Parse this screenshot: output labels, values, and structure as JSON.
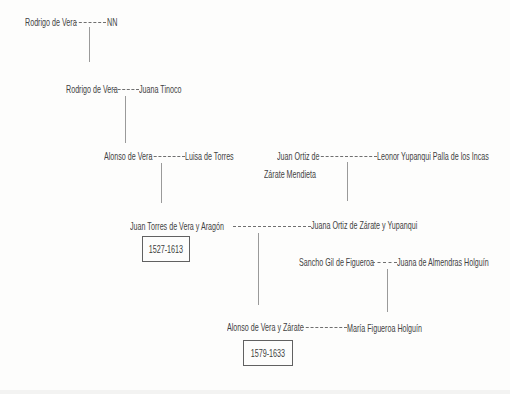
{
  "diagram": {
    "type": "family-tree",
    "colors": {
      "background": "#fdfdfc",
      "text": "#424242",
      "marriage_dash_line": "#6f6f6f",
      "descent_line": "#9a9a9a",
      "dates_box_border": "#616161"
    }
  },
  "tree": {
    "gen1": {
      "husband": "Rodrigo de Vera",
      "wife": "NN"
    },
    "gen2": {
      "husband": "Rodrigo de Vera",
      "wife": "Juana Tinoco"
    },
    "gen3a": {
      "husband": "Alonso de Vera",
      "wife": "Luisa de Torres"
    },
    "gen3b": {
      "husband_line1": "Juan Ortiz de",
      "husband_line2": "Zárate Mendieta",
      "wife": "Leonor Yupanqui Palla de los Incas"
    },
    "gen4a": {
      "husband": "Juan Torres de Vera y Aragón",
      "husband_dates": "1527-1613",
      "wife": "Juana Ortiz de Zárate y Yupanqui"
    },
    "gen4b": {
      "husband": "Sancho Gil de Figueroa",
      "wife": "Juana de Almendras Holguín"
    },
    "gen5": {
      "husband": "Alonso de Vera y Zárate",
      "husband_dates": "1579-1633",
      "wife": "María Figueroa Holguín"
    }
  }
}
